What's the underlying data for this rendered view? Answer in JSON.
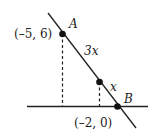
{
  "diagram": {
    "point_a": {
      "name": "A",
      "coords_label": "(–5, 6)"
    },
    "point_b": {
      "name": "B",
      "coords_label": "(–2, 0)"
    },
    "segment_upper_label": "3x",
    "segment_lower_label": "x",
    "colors": {
      "stroke": "#222222",
      "background": "#ffffff"
    }
  }
}
